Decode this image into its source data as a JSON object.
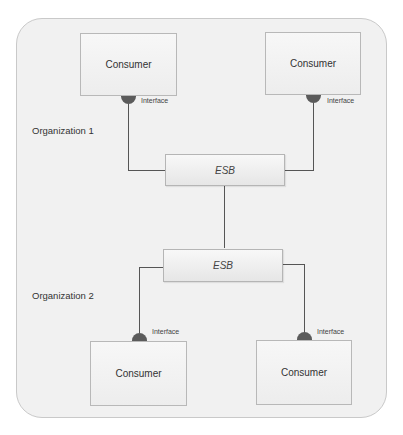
{
  "diagram": {
    "consumers": [
      {
        "label": "Consumer",
        "interface": "Interface"
      },
      {
        "label": "Consumer",
        "interface": "Interface"
      },
      {
        "label": "Consumer",
        "interface": "Interface"
      },
      {
        "label": "Consumer",
        "interface": "Interface"
      }
    ],
    "esb": [
      {
        "label": "ESB"
      },
      {
        "label": "ESB"
      }
    ],
    "organizations": [
      {
        "label": "Organization 1"
      },
      {
        "label": "Organization 2"
      }
    ],
    "colors": {
      "frame_border": "#c9c9c9",
      "frame_fill": "#f1f1f1",
      "knob": "#5b5b5b",
      "line": "#555555"
    }
  }
}
